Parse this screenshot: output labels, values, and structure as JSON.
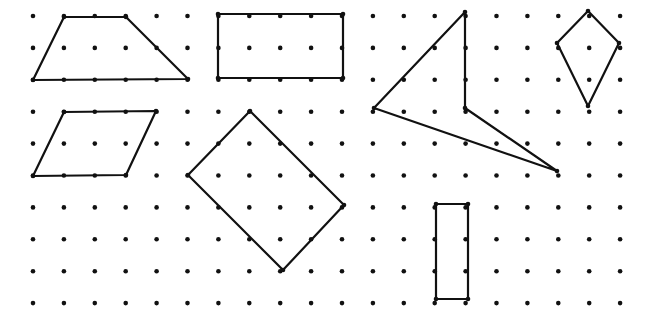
{
  "figure": {
    "type": "geoboard dot grid with polygons",
    "grid": {
      "columns": 20,
      "rows": 10,
      "origin": [
        33,
        16
      ],
      "spacing_x": 30.9,
      "spacing_y": 31.9,
      "dot_color": "#111111"
    },
    "shapes": [
      {
        "name": "trapezoid",
        "points": [
          [
            64,
            17
          ],
          [
            126,
            17
          ],
          [
            188,
            79
          ],
          [
            33,
            80
          ]
        ]
      },
      {
        "name": "rectangle-wide",
        "points": [
          [
            218,
            14
          ],
          [
            343,
            14
          ],
          [
            343,
            78
          ],
          [
            218,
            78
          ]
        ]
      },
      {
        "name": "concave-quadrilateral",
        "points": [
          [
            465,
            12
          ],
          [
            465,
            108
          ],
          [
            557,
            171
          ],
          [
            374,
            108
          ]
        ]
      },
      {
        "name": "kite",
        "points": [
          [
            588,
            11
          ],
          [
            619,
            43
          ],
          [
            588,
            106
          ],
          [
            557,
            43
          ]
        ]
      },
      {
        "name": "parallelogram",
        "points": [
          [
            64,
            112
          ],
          [
            156,
            111
          ],
          [
            126,
            175
          ],
          [
            33,
            176
          ]
        ]
      },
      {
        "name": "tilted-rectangle",
        "points": [
          [
            250,
            111
          ],
          [
            344,
            205
          ],
          [
            283,
            270
          ],
          [
            188,
            175
          ]
        ]
      },
      {
        "name": "rectangle-tall",
        "points": [
          [
            436,
            204
          ],
          [
            468,
            204
          ],
          [
            468,
            299
          ],
          [
            436,
            299
          ]
        ]
      }
    ],
    "stroke_color": "#111111"
  }
}
